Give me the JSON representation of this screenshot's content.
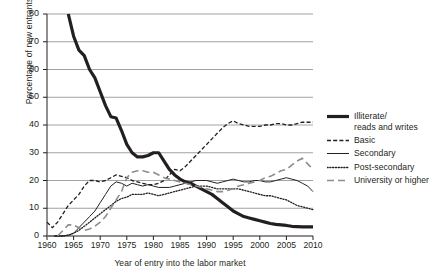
{
  "chart_data": {
    "type": "line",
    "title": "",
    "xlabel": "Year of entry into the labor market",
    "ylabel": "Percentage of new entrants",
    "xlim": [
      1960,
      2010
    ],
    "ylim": [
      0,
      80
    ],
    "xticks": [
      1960,
      1965,
      1970,
      1975,
      1980,
      1985,
      1990,
      1995,
      2000,
      2005,
      2010
    ],
    "yticks": [
      0,
      10,
      20,
      30,
      40,
      50,
      60,
      70,
      80
    ],
    "grid": "horizontal",
    "legend_position": "right",
    "x": [
      1960,
      1961,
      1962,
      1963,
      1964,
      1965,
      1966,
      1967,
      1968,
      1969,
      1970,
      1971,
      1972,
      1973,
      1974,
      1975,
      1976,
      1977,
      1978,
      1979,
      1980,
      1981,
      1982,
      1983,
      1984,
      1985,
      1986,
      1987,
      1988,
      1989,
      1990,
      1991,
      1992,
      1993,
      1994,
      1995,
      1996,
      1997,
      1998,
      1999,
      2000,
      2001,
      2002,
      2003,
      2004,
      2005,
      2006,
      2007,
      2008,
      2009,
      2010
    ],
    "series": [
      {
        "name": "Illiterate/reads and writes",
        "style": "solid-thick",
        "color": "#231f20",
        "width": 3.2,
        "values": [
          null,
          null,
          null,
          null,
          80,
          72,
          67,
          65,
          60,
          57,
          52,
          47,
          43,
          42.5,
          38,
          33,
          30,
          28.5,
          28.5,
          29,
          30,
          30,
          27,
          24,
          22,
          20.5,
          19.5,
          19,
          18,
          17,
          16,
          15,
          13.5,
          12,
          10.5,
          9,
          8,
          7,
          6.5,
          6,
          5.5,
          5,
          4.5,
          4.2,
          4,
          3.8,
          3.5,
          3.4,
          3.3,
          3.3,
          3.3
        ]
      },
      {
        "name": "Basic",
        "style": "dashed",
        "color": "#231f20",
        "width": 1.3,
        "values": [
          5,
          3,
          5,
          8,
          11,
          13,
          15,
          18,
          20,
          20,
          19.5,
          20,
          21,
          22,
          21.5,
          21,
          20,
          19.5,
          19,
          18.5,
          18.5,
          19,
          20,
          22,
          24,
          23.5,
          25,
          27,
          29,
          31,
          33,
          35,
          37,
          39,
          40.5,
          41.5,
          40.5,
          40,
          39.5,
          39.5,
          39.5,
          40,
          40,
          40.5,
          40.5,
          40,
          40,
          40.5,
          41,
          41,
          41
        ]
      },
      {
        "name": "Secondary",
        "style": "solid-thin",
        "color": "#231f20",
        "width": 1.0,
        "values": [
          0,
          0,
          0,
          0,
          0.3,
          1,
          3,
          5,
          7,
          9,
          12,
          15,
          18,
          19.5,
          19,
          18,
          19,
          18.5,
          18,
          18.5,
          18,
          17.5,
          17.5,
          17.5,
          18,
          18.5,
          19,
          19.5,
          20,
          20,
          20,
          19.5,
          19,
          19.5,
          20,
          20.5,
          20,
          19.5,
          19.5,
          20,
          20,
          19.5,
          19.5,
          20,
          20.5,
          21,
          20.5,
          20,
          19,
          18,
          16
        ]
      },
      {
        "name": "Post-secondary",
        "style": "dotted",
        "color": "#231f20",
        "width": 1.3,
        "values": [
          0,
          0,
          0,
          0,
          0.3,
          1,
          2,
          3.5,
          5,
          6.5,
          8,
          9.5,
          11,
          12.5,
          13.5,
          14,
          15,
          15,
          15,
          15.5,
          15,
          14.5,
          15,
          15.5,
          16,
          16.5,
          17,
          17.5,
          18,
          18,
          18,
          17.5,
          17,
          17,
          17,
          17,
          17,
          16.5,
          16,
          15.5,
          15,
          14.5,
          14.5,
          14,
          13.5,
          13,
          12,
          11,
          10.5,
          10,
          9.5
        ]
      },
      {
        "name": "University or higher",
        "style": "long-dashed",
        "color": "#8d8d8d",
        "width": 1.6,
        "values": [
          0,
          0,
          0,
          2,
          4,
          4,
          3,
          2,
          2.5,
          3.5,
          5,
          7,
          10,
          13,
          16,
          21,
          23,
          23.5,
          23.5,
          23,
          23,
          22,
          21,
          20.5,
          20,
          19.5,
          19,
          18.5,
          18,
          17.5,
          17,
          16.5,
          16,
          16,
          16.5,
          17,
          18,
          18.5,
          19,
          19.5,
          20,
          21,
          21.5,
          22.5,
          23.5,
          24,
          25.5,
          27,
          28,
          26,
          24
        ]
      }
    ]
  },
  "legend": {
    "items": [
      {
        "label_line1": "Illiterate/",
        "label_line2": "reads and writes",
        "key": "solid-thick-key"
      },
      {
        "label_line1": "Basic",
        "label_line2": "",
        "key": "dashed-key"
      },
      {
        "label_line1": "Secondary",
        "label_line2": "",
        "key": "solid-thin-key"
      },
      {
        "label_line1": "Post-secondary",
        "label_line2": "",
        "key": "dotted-key"
      },
      {
        "label_line1": "University or higher",
        "label_line2": "",
        "key": "long-dashed-key"
      }
    ]
  },
  "colors": {
    "ink": "#231f20",
    "grid": "#8a8a8a",
    "gray_series": "#8d8d8d",
    "background": "#ffffff"
  }
}
